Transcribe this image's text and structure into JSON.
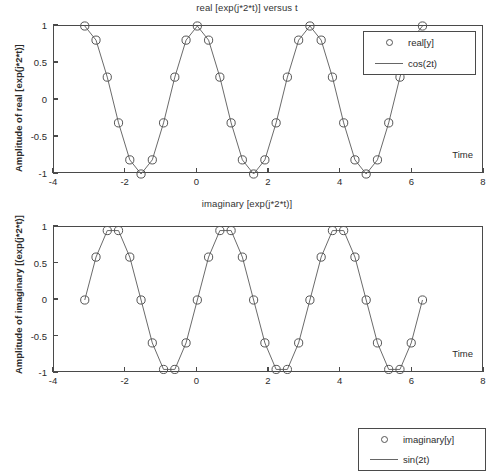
{
  "figure": {
    "width": 494,
    "height": 401,
    "background": "#ffffff",
    "axis_color": "#4a4a4a",
    "line_color": "#6b6b6b",
    "marker_color": "#555555"
  },
  "panels": [
    {
      "id": "real",
      "title": "real [exp(j*2*t)] versus t",
      "ylabel": "Amplitude of real [exp(j*2*t)]",
      "xlabel": "Time",
      "legend": [
        {
          "key": "circle-marker",
          "label": "real[y]"
        },
        {
          "key": "solid-line",
          "label": "cos(2t)"
        }
      ]
    },
    {
      "id": "imaginary",
      "title": "imaginary [exp(j*2*t)]",
      "ylabel": "Amplitude of imaginary [(exp(j*2*t)]",
      "xlabel": "Time",
      "legend": [
        {
          "key": "circle-marker",
          "label": "imaginary[y]"
        },
        {
          "key": "solid-line",
          "label": "sin(2t)"
        }
      ]
    }
  ],
  "axes": {
    "xticks": [
      "-4",
      "-2",
      "0",
      "2",
      "4",
      "6",
      "8"
    ],
    "xtick_values": [
      -4,
      -2,
      0,
      2,
      4,
      6,
      8
    ],
    "yticks": [
      "1",
      "0.5",
      "0",
      "-0.5",
      "-1"
    ],
    "ytick_values": [
      1,
      0.5,
      0,
      -0.5,
      -1
    ],
    "xlim": [
      -4,
      8
    ],
    "ylim": [
      -1,
      1
    ]
  },
  "chart_data": [
    {
      "type": "line",
      "title": "real [exp(j*2*t)] versus t",
      "xlabel": "Time",
      "ylabel": "Amplitude of real [exp(j*2*t)]",
      "xlim": [
        -4,
        8
      ],
      "ylim": [
        -1,
        1
      ],
      "grid": false,
      "legend_position": "upper right",
      "series": [
        {
          "name": "real[y]",
          "marker": "o",
          "linestyle": "-",
          "x": [
            -3.1416,
            -2.8274,
            -2.5133,
            -2.1991,
            -1.885,
            -1.5708,
            -1.2566,
            -0.9425,
            -0.6283,
            -0.3142,
            0,
            0.3142,
            0.6283,
            0.9425,
            1.2566,
            1.5708,
            1.885,
            2.1991,
            2.5133,
            2.8274,
            3.1416,
            3.4558,
            3.7699,
            4.0841,
            4.3982,
            4.7124,
            5.0265,
            5.3407,
            5.6549,
            5.969,
            6.2832
          ],
          "y": [
            1,
            0.809,
            0.309,
            -0.309,
            -0.809,
            -1,
            -0.809,
            -0.309,
            0.309,
            0.809,
            1,
            0.809,
            0.309,
            -0.309,
            -0.809,
            -1,
            -0.809,
            -0.309,
            0.309,
            0.809,
            1,
            0.809,
            0.309,
            -0.309,
            -0.809,
            -1,
            -0.809,
            -0.309,
            0.309,
            0.809,
            1
          ]
        },
        {
          "name": "cos(2t)",
          "marker": "none",
          "linestyle": "-"
        }
      ]
    },
    {
      "type": "line",
      "title": "imaginary [exp(j*2*t)]",
      "xlabel": "Time",
      "ylabel": "Amplitude of imaginary [(exp(j*2*t)]",
      "xlim": [
        -4,
        8
      ],
      "ylim": [
        -1,
        1
      ],
      "grid": false,
      "legend_position": "upper right",
      "series": [
        {
          "name": "imaginary[y]",
          "marker": "o",
          "linestyle": "-",
          "x": [
            -3.1416,
            -2.8274,
            -2.5133,
            -2.1991,
            -1.885,
            -1.5708,
            -1.2566,
            -0.9425,
            -0.6283,
            -0.3142,
            0,
            0.3142,
            0.6283,
            0.9425,
            1.2566,
            1.5708,
            1.885,
            2.1991,
            2.5133,
            2.8274,
            3.1416,
            3.4558,
            3.7699,
            4.0841,
            4.3982,
            4.7124,
            5.0265,
            5.3407,
            5.6549,
            5.969,
            6.2832
          ],
          "y": [
            0,
            0.5878,
            0.9511,
            0.9511,
            0.5878,
            0,
            -0.5878,
            -0.9511,
            -0.9511,
            -0.5878,
            0,
            0.5878,
            0.9511,
            0.9511,
            0.5878,
            0,
            -0.5878,
            -0.9511,
            -0.9511,
            -0.5878,
            0,
            0.5878,
            0.9511,
            0.9511,
            0.5878,
            0,
            -0.5878,
            -0.9511,
            -0.9511,
            -0.5878,
            0
          ]
        },
        {
          "name": "sin(2t)",
          "marker": "none",
          "linestyle": "-"
        }
      ]
    }
  ]
}
